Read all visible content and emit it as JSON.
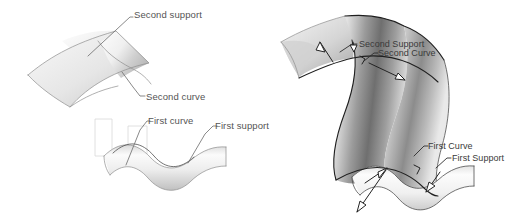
{
  "figure": {
    "background_color": "#ffffff",
    "line_color": "#6b6b6b",
    "dark_line_color": "#1f1f1f",
    "text_color": "#545454",
    "caption": ""
  },
  "left_figure": {
    "name": "inputs-figure",
    "description": "Two separate input surfaces with their guide curves",
    "labels": [
      {
        "id": "second-support",
        "text": "Second support",
        "x": 134,
        "y": 15,
        "anchor": "start"
      },
      {
        "id": "second-curve",
        "text": "Second curve",
        "x": 146,
        "y": 99,
        "anchor": "start"
      },
      {
        "id": "first-curve",
        "text": "First curve",
        "x": 148,
        "y": 123,
        "anchor": "start"
      },
      {
        "id": "first-support",
        "text": "First support",
        "x": 215,
        "y": 128,
        "anchor": "start"
      }
    ]
  },
  "right_figure": {
    "name": "result-figure",
    "description": "Resulting blend surface connecting first and second supports",
    "labels": [
      {
        "id": "second-support-r",
        "text": "Second Support",
        "x": 360,
        "y": 44,
        "anchor": "start"
      },
      {
        "id": "second-curve-r",
        "text": "Second Curve",
        "x": 377,
        "y": 53,
        "anchor": "start"
      },
      {
        "id": "first-curve-r",
        "text": "First Curve",
        "x": 428,
        "y": 145,
        "anchor": "start"
      },
      {
        "id": "first-support-r",
        "text": "First Support",
        "x": 452,
        "y": 157,
        "anchor": "start"
      }
    ]
  }
}
